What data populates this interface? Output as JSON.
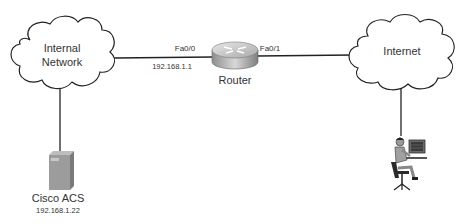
{
  "nodes": {
    "internal_network": {
      "line1": "Internal",
      "line2": "Network"
    },
    "internet": {
      "label": "Internet"
    },
    "router": {
      "label": "Router",
      "port_left": "Fa0/0",
      "port_right": "Fa0/1",
      "ip_left": "192.168.1.1"
    },
    "acs": {
      "label": "Cisco ACS",
      "ip": "192.168.1.22"
    },
    "user": {
      "label": ""
    }
  },
  "colors": {
    "line": "#222222",
    "device_gray": "#9a9a9a"
  }
}
